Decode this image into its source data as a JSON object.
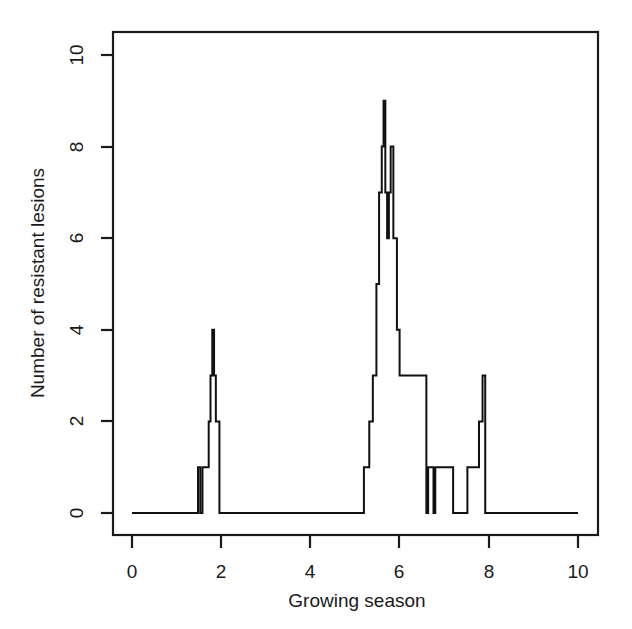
{
  "figure": {
    "background_color": "#ffffff",
    "line_color": "#111111",
    "text_color": "#1a1a1a"
  },
  "chart_data": {
    "type": "line",
    "subtype": "step",
    "title": "",
    "subtitle": "",
    "xlabel": "Growing season",
    "ylabel": "Number of resistant lesions",
    "xlim": [
      -0.35,
      10.45
    ],
    "ylim": [
      -0.35,
      10.5
    ],
    "xticks": [
      0,
      2,
      4,
      6,
      8,
      10
    ],
    "xticklabels": [
      "0",
      "2",
      "4",
      "6",
      "8",
      "10"
    ],
    "yticks": [
      0,
      2,
      4,
      6,
      8,
      10
    ],
    "yticklabels": [
      "0",
      "2",
      "4",
      "6",
      "8",
      "10"
    ],
    "grid": false,
    "legend": null,
    "series": [
      {
        "name": "Number of resistant lesions",
        "color": "#111111",
        "step_mode": "post",
        "x": [
          0.0,
          1.48,
          1.53,
          1.58,
          1.72,
          1.76,
          1.8,
          1.84,
          1.88,
          1.96,
          5.2,
          5.32,
          5.4,
          5.48,
          5.54,
          5.6,
          5.64,
          5.68,
          5.72,
          5.76,
          5.8,
          5.86,
          5.94,
          6.0,
          6.6,
          6.64,
          6.76,
          6.8,
          7.2,
          7.52,
          7.6,
          7.78,
          7.86,
          7.92,
          10.0
        ],
        "y": [
          0,
          1,
          0,
          1,
          2,
          3,
          4,
          3,
          2,
          0,
          1,
          2,
          3,
          5,
          7,
          8,
          9,
          7,
          6,
          7,
          8,
          6,
          4,
          3,
          0,
          1,
          0,
          1,
          0,
          1,
          1,
          2,
          3,
          0,
          0
        ]
      }
    ],
    "annotations": [],
    "peaks": [
      {
        "label": "first-peak",
        "x_center": 1.8,
        "max_value": 4
      },
      {
        "label": "main-peak",
        "x_center": 5.64,
        "max_value": 9
      },
      {
        "label": "late-peak",
        "x_center": 7.86,
        "max_value": 3
      }
    ]
  }
}
